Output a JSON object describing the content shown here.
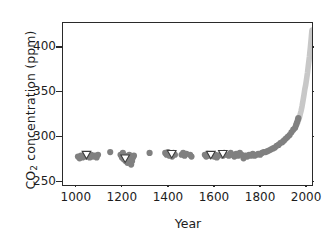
{
  "chart_data": {
    "type": "scatter",
    "title": "",
    "xlabel": "Year",
    "ylabel": "CO2 concentration (ppm)",
    "ylabel_parts": {
      "prefix": "CO",
      "subscript": "2",
      "suffix": " concentration (ppm)"
    },
    "xlim": [
      940,
      2030
    ],
    "ylim": [
      245,
      428
    ],
    "xticks": [
      1000,
      1200,
      1400,
      1600,
      1800,
      2000
    ],
    "yticks": [
      250,
      300,
      350,
      400
    ],
    "xtick_labels": [
      "1000",
      "1200",
      "1400",
      "1600",
      "1800",
      "2000"
    ],
    "ytick_labels": [
      "250",
      "300",
      "350",
      "400"
    ],
    "grid": false,
    "legend": "none",
    "colors": {
      "ice_core_circles": "#808080",
      "open_triangles_fill": "#ffffff",
      "open_triangles_edge": "#3c3c3c",
      "direct_measurements": "#c8c8c8",
      "axis": "#2a2a2a",
      "text": "#1d1d1d",
      "background": "#ffffff"
    },
    "series": [
      {
        "name": "ice-core-circles",
        "marker": "circle",
        "color": "#808080",
        "points": [
          [
            1005,
            279
          ],
          [
            1012,
            277
          ],
          [
            1018,
            280
          ],
          [
            1025,
            278
          ],
          [
            1032,
            281
          ],
          [
            1040,
            279
          ],
          [
            1048,
            280
          ],
          [
            1056,
            278
          ],
          [
            1063,
            281
          ],
          [
            1070,
            279
          ],
          [
            1078,
            280
          ],
          [
            1086,
            278
          ],
          [
            1092,
            281
          ],
          [
            1145,
            284
          ],
          [
            1190,
            281
          ],
          [
            1196,
            278
          ],
          [
            1200,
            283
          ],
          [
            1204,
            276
          ],
          [
            1208,
            280
          ],
          [
            1212,
            274
          ],
          [
            1216,
            279
          ],
          [
            1220,
            272
          ],
          [
            1224,
            277
          ],
          [
            1228,
            281
          ],
          [
            1232,
            275
          ],
          [
            1236,
            270
          ],
          [
            1240,
            274
          ],
          [
            1244,
            278
          ],
          [
            1248,
            280
          ],
          [
            1316,
            283
          ],
          [
            1384,
            283
          ],
          [
            1390,
            281
          ],
          [
            1396,
            284
          ],
          [
            1402,
            280
          ],
          [
            1408,
            282
          ],
          [
            1414,
            279
          ],
          [
            1420,
            283
          ],
          [
            1426,
            281
          ],
          [
            1455,
            281
          ],
          [
            1462,
            283
          ],
          [
            1468,
            280
          ],
          [
            1476,
            282
          ],
          [
            1492,
            281
          ],
          [
            1498,
            279
          ],
          [
            1556,
            281
          ],
          [
            1562,
            279
          ],
          [
            1568,
            282
          ],
          [
            1574,
            280
          ],
          [
            1596,
            279
          ],
          [
            1602,
            281
          ],
          [
            1608,
            278
          ],
          [
            1614,
            280
          ],
          [
            1628,
            282
          ],
          [
            1634,
            280
          ],
          [
            1640,
            283
          ],
          [
            1646,
            281
          ],
          [
            1660,
            280
          ],
          [
            1668,
            283
          ],
          [
            1676,
            281
          ],
          [
            1684,
            279
          ],
          [
            1692,
            282
          ],
          [
            1700,
            280
          ],
          [
            1708,
            283
          ],
          [
            1716,
            281
          ],
          [
            1724,
            277
          ],
          [
            1732,
            280
          ],
          [
            1740,
            279
          ],
          [
            1748,
            281
          ],
          [
            1756,
            280
          ],
          [
            1764,
            282
          ],
          [
            1772,
            280
          ],
          [
            1780,
            281
          ],
          [
            1788,
            282
          ],
          [
            1796,
            281
          ],
          [
            1804,
            283
          ],
          [
            1812,
            284
          ],
          [
            1820,
            284
          ],
          [
            1828,
            285
          ],
          [
            1836,
            286
          ],
          [
            1844,
            287
          ],
          [
            1852,
            288
          ],
          [
            1860,
            289
          ],
          [
            1868,
            291
          ],
          [
            1876,
            292
          ],
          [
            1884,
            294
          ],
          [
            1892,
            295
          ],
          [
            1900,
            297
          ],
          [
            1908,
            299
          ],
          [
            1916,
            301
          ],
          [
            1924,
            303
          ],
          [
            1932,
            306
          ],
          [
            1940,
            309
          ],
          [
            1948,
            311
          ],
          [
            1952,
            314
          ],
          [
            1956,
            317
          ],
          [
            1960,
            320
          ],
          [
            1962,
            322
          ]
        ]
      },
      {
        "name": "open-triangles",
        "marker": "triangle-down",
        "fill": "#ffffff",
        "edge": "#3c3c3c",
        "points": [
          [
            1042,
            281
          ],
          [
            1210,
            277
          ],
          [
            1412,
            282
          ],
          [
            1582,
            281
          ],
          [
            1634,
            282
          ]
        ]
      },
      {
        "name": "direct-measurements",
        "marker": "line",
        "color": "#c8c8c8",
        "points": [
          [
            1958,
            316
          ],
          [
            1962,
            319
          ],
          [
            1966,
            322
          ],
          [
            1970,
            326
          ],
          [
            1974,
            330
          ],
          [
            1978,
            335
          ],
          [
            1982,
            341
          ],
          [
            1986,
            347
          ],
          [
            1990,
            354
          ],
          [
            1994,
            359
          ],
          [
            1998,
            366
          ],
          [
            2002,
            373
          ],
          [
            2006,
            382
          ],
          [
            2010,
            390
          ],
          [
            2014,
            400
          ],
          [
            2018,
            411
          ],
          [
            2021,
            420
          ]
        ]
      }
    ]
  },
  "axes": {
    "x_label": "Year",
    "y_label_prefix": "CO",
    "y_label_sub": "2",
    "y_label_suffix": " concentration (ppm)"
  }
}
